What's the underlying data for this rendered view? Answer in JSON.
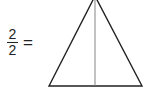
{
  "equation": {
    "numerator": "2",
    "denominator": "2",
    "equals": "="
  },
  "figure": {
    "shape": "triangle",
    "divided_into_parts": 2,
    "outline_color": "#222222",
    "divider_color": "#777777"
  }
}
